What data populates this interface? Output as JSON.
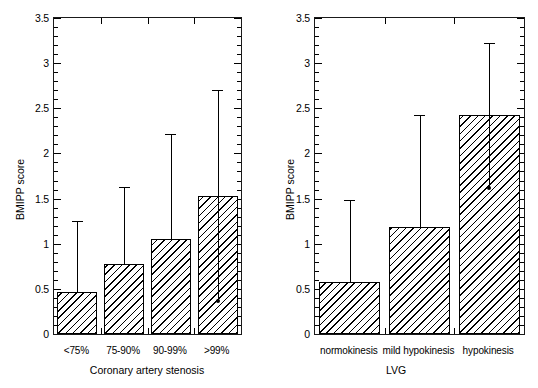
{
  "figure": {
    "background": "#ffffff",
    "ink_color": "#000000"
  },
  "chart_data": [
    {
      "panel": "left",
      "type": "bar",
      "title": "",
      "xlabel": "Coronary artery stenosis",
      "ylabel": "BMIPP score",
      "categories": [
        "<75%",
        "75-90%",
        "90-99%",
        ">99%"
      ],
      "values": [
        0.47,
        0.77,
        1.05,
        1.53
      ],
      "error_upper": [
        1.25,
        1.63,
        2.22,
        2.7
      ],
      "error_lower": [
        null,
        null,
        null,
        0.36
      ],
      "ylim": [
        0,
        3.5
      ],
      "yticks": [
        0,
        0.5,
        1,
        1.5,
        2,
        2.5,
        3,
        3.5
      ],
      "ytick_labels": [
        "0",
        "0.5",
        "1",
        "1.5",
        "2",
        "2.5",
        "3",
        "3.5"
      ],
      "minor_tick_step": 0.1,
      "grid": false,
      "legend": "none",
      "bar_fill": "diagonal-hatch"
    },
    {
      "panel": "right",
      "type": "bar",
      "title": "",
      "xlabel": "LVG",
      "ylabel": "BMIPP score",
      "categories": [
        "normokinesis",
        "mild hypokinesis",
        "hypokinesis"
      ],
      "values": [
        0.58,
        1.18,
        2.43
      ],
      "error_upper": [
        1.48,
        2.43,
        3.22
      ],
      "error_lower": [
        null,
        null,
        1.62
      ],
      "ylim": [
        0,
        3.5
      ],
      "yticks": [
        0,
        0.5,
        1,
        1.5,
        2,
        2.5,
        3,
        3.5
      ],
      "ytick_labels": [
        "0",
        "0.5",
        "1",
        "1.5",
        "2",
        "2.5",
        "3",
        "3.5"
      ],
      "minor_tick_step": 0.1,
      "grid": false,
      "legend": "none",
      "bar_fill": "diagonal-hatch"
    }
  ]
}
